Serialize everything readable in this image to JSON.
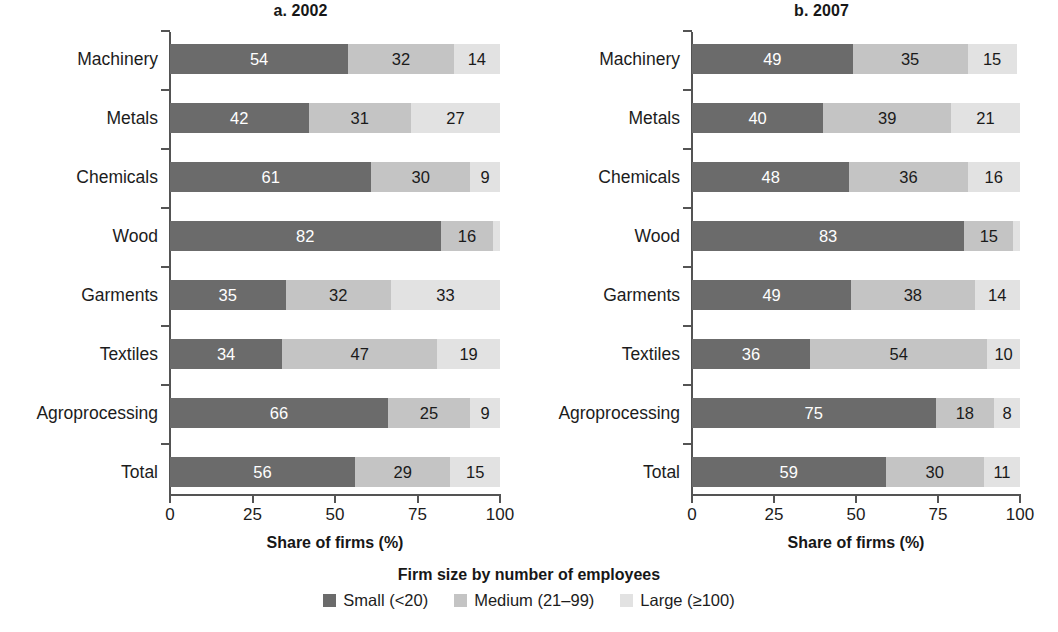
{
  "figure": {
    "x_axis_title": "Share of firms (%)",
    "x_ticks": [
      "0",
      "25",
      "50",
      "75",
      "100"
    ]
  },
  "legend": {
    "title": "Firm size by number of employees",
    "items": [
      {
        "label": "Small (<20)",
        "color": "#6b6b6b"
      },
      {
        "label": "Medium (21–99)",
        "color": "#c4c4c4"
      },
      {
        "label": "Large (≥100)",
        "color": "#e2e2e2"
      }
    ]
  },
  "panels": [
    {
      "title": "a. 2002"
    },
    {
      "title": "b. 2007"
    }
  ],
  "chart_data": [
    {
      "type": "bar",
      "orientation": "horizontal",
      "stacked": true,
      "title": "a. 2002",
      "xlabel": "Share of firms (%)",
      "ylabel": "",
      "xlim": [
        0,
        100
      ],
      "xticks": [
        0,
        25,
        50,
        75,
        100
      ],
      "grid": false,
      "legend_position": "bottom-center",
      "legend_title": "Firm size by number of employees",
      "categories": [
        "Machinery",
        "Metals",
        "Chemicals",
        "Wood",
        "Garments",
        "Textiles",
        "Agroprocessing",
        "Total"
      ],
      "series": [
        {
          "name": "Small (<20)",
          "color": "#6b6b6b",
          "values": [
            54,
            42,
            61,
            82,
            35,
            34,
            66,
            56
          ]
        },
        {
          "name": "Medium (21–99)",
          "color": "#c4c4c4",
          "values": [
            32,
            31,
            30,
            16,
            32,
            47,
            25,
            29
          ]
        },
        {
          "name": "Large (≥100)",
          "color": "#e2e2e2",
          "values": [
            14,
            27,
            9,
            2,
            33,
            19,
            9,
            15
          ]
        }
      ],
      "data_labels": {
        "Machinery": [
          "54",
          "32",
          "14"
        ],
        "Metals": [
          "42",
          "31",
          "27"
        ],
        "Chemicals": [
          "61",
          "30",
          "9"
        ],
        "Wood": [
          "82",
          "16",
          ""
        ],
        "Garments": [
          "35",
          "32",
          "33"
        ],
        "Textiles": [
          "34",
          "47",
          "19"
        ],
        "Agroprocessing": [
          "66",
          "25",
          "9"
        ],
        "Total": [
          "56",
          "29",
          "15"
        ]
      }
    },
    {
      "type": "bar",
      "orientation": "horizontal",
      "stacked": true,
      "title": "b. 2007",
      "xlabel": "Share of firms (%)",
      "ylabel": "",
      "xlim": [
        0,
        100
      ],
      "xticks": [
        0,
        25,
        50,
        75,
        100
      ],
      "grid": false,
      "legend_position": "bottom-center",
      "legend_title": "Firm size by number of employees",
      "categories": [
        "Machinery",
        "Metals",
        "Chemicals",
        "Wood",
        "Garments",
        "Textiles",
        "Agroprocessing",
        "Total"
      ],
      "series": [
        {
          "name": "Small (<20)",
          "color": "#6b6b6b",
          "values": [
            49,
            40,
            48,
            83,
            49,
            36,
            75,
            59
          ]
        },
        {
          "name": "Medium (21–99)",
          "color": "#c4c4c4",
          "values": [
            35,
            39,
            36,
            15,
            38,
            54,
            18,
            30
          ]
        },
        {
          "name": "Large (≥100)",
          "color": "#e2e2e2",
          "values": [
            15,
            21,
            16,
            2,
            14,
            10,
            8,
            11
          ]
        }
      ],
      "data_labels": {
        "Machinery": [
          "49",
          "35",
          "15"
        ],
        "Metals": [
          "40",
          "39",
          "21"
        ],
        "Chemicals": [
          "48",
          "36",
          "16"
        ],
        "Wood": [
          "83",
          "15",
          ""
        ],
        "Garments": [
          "49",
          "38",
          "14"
        ],
        "Textiles": [
          "36",
          "54",
          "10"
        ],
        "Agroprocessing": [
          "75",
          "18",
          "8"
        ],
        "Total": [
          "59",
          "30",
          "11"
        ]
      }
    }
  ]
}
